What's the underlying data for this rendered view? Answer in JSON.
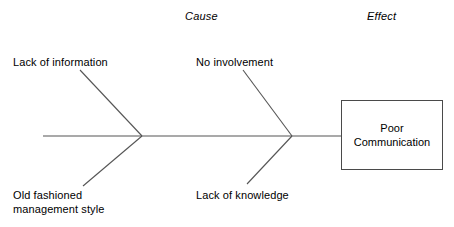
{
  "diagram": {
    "type": "fishbone-ishikawa",
    "headers": {
      "cause": "Cause",
      "effect": "Effect"
    },
    "effect_box": {
      "line1": "Poor",
      "line2": "Communication",
      "text": "Poor\nCommunication"
    },
    "causes": [
      {
        "id": "lack-of-information",
        "label": "Lack of information",
        "position": "upper-left",
        "branch": 1
      },
      {
        "id": "old-fashioned-management-style",
        "label": "Old fashioned\nmanagement style",
        "line1": "Old fashioned",
        "line2": "management style",
        "position": "lower-left",
        "branch": 1
      },
      {
        "id": "no-involvement",
        "label": "No involvement",
        "position": "upper-middle",
        "branch": 2
      },
      {
        "id": "lack-of-knowledge",
        "label": "Lack of knowledge",
        "position": "lower-middle",
        "branch": 2
      }
    ],
    "colors": {
      "line": "#555555",
      "box_border": "#4a4a4a",
      "text": "#000000",
      "background": "#ffffff"
    },
    "geometry": {
      "spine": {
        "x1": 43,
        "y1": 136,
        "x2": 341,
        "y2": 136
      },
      "bones": [
        {
          "id": "bone-upper-left",
          "x1": 80,
          "y1": 70,
          "x2": 142,
          "y2": 136
        },
        {
          "id": "bone-lower-left",
          "x1": 142,
          "y1": 136,
          "x2": 83,
          "y2": 186
        },
        {
          "id": "bone-upper-middle",
          "x1": 243,
          "y1": 70,
          "x2": 292,
          "y2": 136
        },
        {
          "id": "bone-lower-middle",
          "x1": 292,
          "y1": 136,
          "x2": 247,
          "y2": 184
        }
      ]
    }
  }
}
